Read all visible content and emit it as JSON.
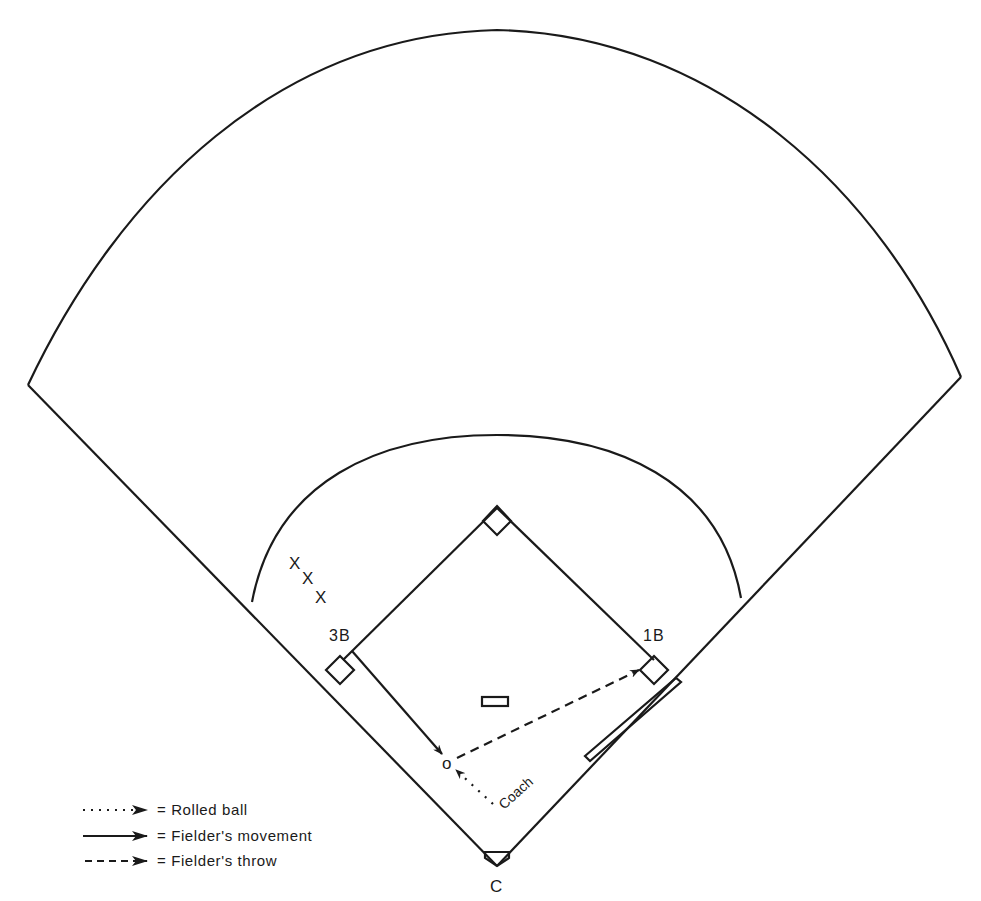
{
  "diagram": {
    "labels": {
      "third_base": "3B",
      "first_base": "1B",
      "catcher": "C",
      "coach": "Coach",
      "fielder": "o",
      "waiting_players": [
        "X",
        "X",
        "X"
      ]
    },
    "legend": [
      {
        "style": "dotted",
        "label": "= Rolled ball"
      },
      {
        "style": "solid",
        "label": "= Fielder's movement"
      },
      {
        "style": "dashed",
        "label": "= Fielder's throw"
      }
    ],
    "colors": {
      "ink": "#1a1a1a",
      "background": "#ffffff"
    }
  }
}
